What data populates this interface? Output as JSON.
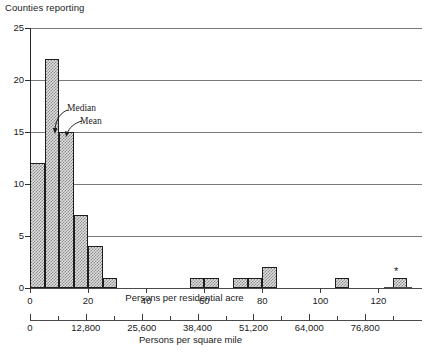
{
  "chart_data": {
    "type": "bar",
    "title": "",
    "ylabel": "Counties reporting",
    "xlabel": "Persons per residential acre",
    "xlabel_secondary": "Persons per square mile",
    "ylim": [
      0,
      25
    ],
    "xlim": [
      0,
      135
    ],
    "grid": true,
    "legend": null,
    "y_ticks": [
      0,
      5,
      10,
      15,
      20,
      25
    ],
    "y_tick_labels": [
      "0",
      "5",
      "10",
      "15",
      "20",
      "25"
    ],
    "x_ticks": [
      0,
      20,
      40,
      60,
      80,
      100,
      120
    ],
    "x_tick_labels": [
      "0",
      "20",
      "40",
      "60",
      "80",
      "100",
      "120"
    ],
    "x2_ticks": [
      0,
      12800,
      25600,
      38400,
      51200,
      64000,
      76800
    ],
    "x2_tick_labels": [
      "0",
      "12,800",
      "25,600",
      "38,400",
      "51,200",
      "64,000",
      "76,800"
    ],
    "bin_width": 5,
    "bins": [
      {
        "x0": 0,
        "x1": 5,
        "value": 12
      },
      {
        "x0": 5,
        "x1": 10,
        "value": 22
      },
      {
        "x0": 10,
        "x1": 15,
        "value": 15
      },
      {
        "x0": 15,
        "x1": 20,
        "value": 7
      },
      {
        "x0": 20,
        "x1": 25,
        "value": 4
      },
      {
        "x0": 25,
        "x1": 30,
        "value": 1
      },
      {
        "x0": 55,
        "x1": 60,
        "value": 1
      },
      {
        "x0": 60,
        "x1": 65,
        "value": 1
      },
      {
        "x0": 70,
        "x1": 75,
        "value": 1
      },
      {
        "x0": 75,
        "x1": 80,
        "value": 1
      },
      {
        "x0": 80,
        "x1": 85,
        "value": 2
      },
      {
        "x0": 105,
        "x1": 110,
        "value": 1
      },
      {
        "x0": 125,
        "x1": 130,
        "value": 1
      }
    ],
    "annotations": [
      {
        "name": "median",
        "label": "Median",
        "x": 10
      },
      {
        "name": "mean",
        "label": "Mean",
        "x": 13
      },
      {
        "name": "outlier",
        "label": "*",
        "x": 148
      }
    ]
  },
  "axes": {
    "y_title": "Counties reporting",
    "x_title_primary": "Persons per residential acre",
    "x_title_secondary": "Persons per square mile"
  },
  "annotations": {
    "median_label": "Median",
    "mean_label": "Mean",
    "outlier_marker": "*"
  },
  "colors": {
    "axis": "#2a2a2a",
    "gridline": "#7a7a7a",
    "bar_fill": "#dedede",
    "bar_stipple": "#8d8d8d",
    "bar_outline": "#1d1d1d",
    "text": "#1a1a1a",
    "background": "#ffffff"
  }
}
